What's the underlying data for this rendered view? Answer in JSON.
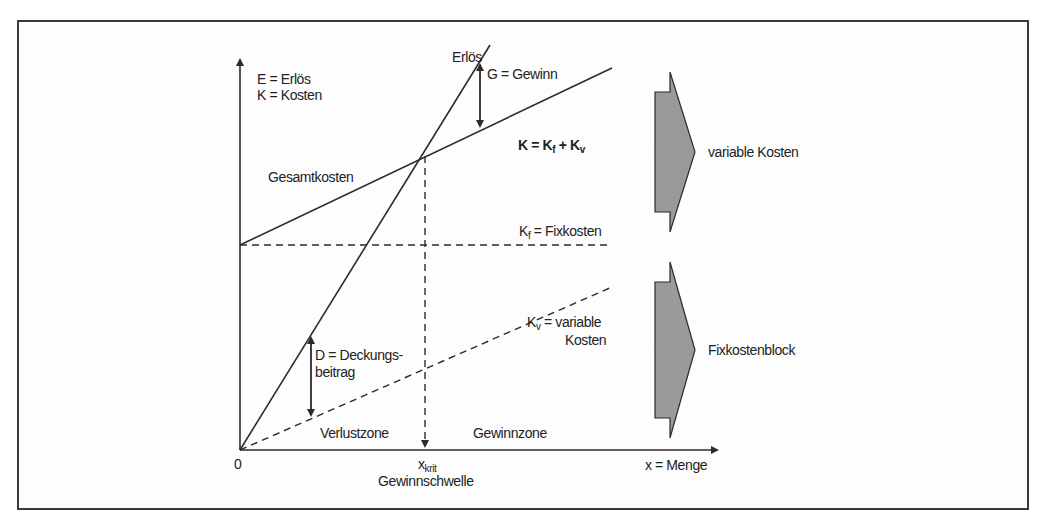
{
  "diagram": {
    "y_axis_label_line1": "E = Erlös",
    "y_axis_label_line2": "K = Kosten",
    "x_axis_label": "x = Menge",
    "origin_label": "0",
    "x_crit_label": "x",
    "x_crit_sub": "krit",
    "break_even_label": "Gewinnschwelle",
    "revenue_line_label": "Erlös",
    "profit_label": "G = Gewinn",
    "total_cost_formula": {
      "K": "K",
      "eq": " = ",
      "Kf": "K",
      "f": "f",
      "plus": " + ",
      "Kv": "K",
      "v": "v"
    },
    "total_cost_label": "Gesamtkosten",
    "fixed_cost_label": {
      "K": "K",
      "sub": "f",
      "rest": " = Fixkosten"
    },
    "variable_cost_label": {
      "K": "K",
      "sub": "v",
      "rest": " = variable",
      "line2": "Kosten"
    },
    "contribution_label_line1": "D = Deckungs-",
    "contribution_label_line2": "beitrag",
    "loss_zone_label": "Verlustzone",
    "profit_zone_label": "Gewinnzone",
    "right_blocks": [
      {
        "label": "variable Kosten"
      },
      {
        "label": "Fixkostenblock"
      }
    ]
  },
  "colors": {
    "line": "#2b2b2b",
    "block_fill": "#9a9a9a",
    "frame": "#3a3a3a"
  }
}
